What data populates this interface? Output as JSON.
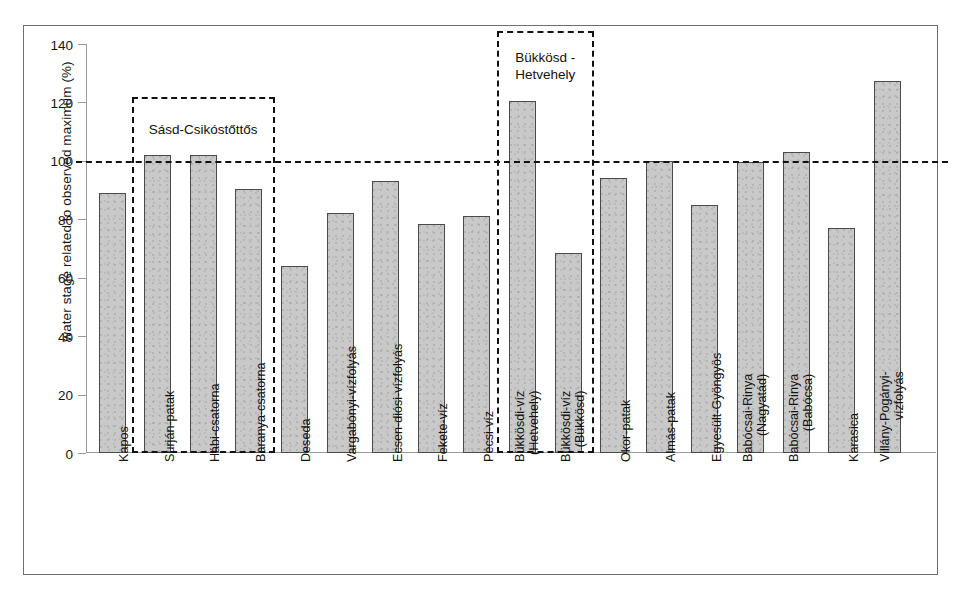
{
  "chart_data": {
    "type": "bar",
    "title": "",
    "subtitle": "",
    "xlabel": "",
    "ylabel": "water stage related to observed maximum (%)",
    "ylim": [
      0,
      140
    ],
    "yticks": [
      0,
      20,
      40,
      60,
      80,
      100,
      120,
      140
    ],
    "grid": false,
    "legend": "none",
    "bar_color": "#c9c9c9",
    "bar_edge_color": "#4a4a4a",
    "reference_lines": [
      {
        "name": "observed-maximum-100pct",
        "value": 100,
        "style": "dashed",
        "color": "#111111"
      }
    ],
    "categories": [
      "Kapos",
      "Surján-patak",
      "Hábi-csatorna",
      "Baranya-csatorna",
      "Deseda",
      "Vargabónyi-vízfolyás",
      "Ecsen-diósi-vízfolyás",
      "Fekete-víz",
      "Pécsi-víz",
      "Bükkösdi-víz (Hetvehely)",
      "Bükkösdi-víz (Bükkösd)",
      "Okor-patak",
      "Almás-patak",
      "Egyesült-Gyöngyös",
      "Babócsai-Rinya (Nagyatád)",
      "Babócsai-Rinya (Babócsa)",
      "Karasica",
      "Villány-Pogányi-vízfolyás"
    ],
    "category_lines": [
      [
        "Kapos"
      ],
      [
        "Surján-patak"
      ],
      [
        "Hábi-csatorna"
      ],
      [
        "Baranya-csatorna"
      ],
      [
        "Deseda"
      ],
      [
        "Vargabónyi-vízfolyás"
      ],
      [
        "Ecsen-diósi-vízfolyás"
      ],
      [
        "Fekete-víz"
      ],
      [
        "Pécsi-víz"
      ],
      [
        "Bükkösdi-víz",
        "(Hetvehely)"
      ],
      [
        "Bükkösdi-víz",
        "(Bükkösd)"
      ],
      [
        "Okor-patak"
      ],
      [
        "Almás-patak"
      ],
      [
        "Egyesült-Gyöngyös"
      ],
      [
        "Babócsai-Rinya",
        "(Nagyatád)"
      ],
      [
        "Babócsai-Rinya",
        "(Babócsa)"
      ],
      [
        "Karasica"
      ],
      [
        "Villány-Pogányi-",
        "vízfolyás"
      ]
    ],
    "values": [
      89,
      102,
      102,
      90.5,
      64,
      82,
      93,
      78.5,
      81,
      120.5,
      68.5,
      94,
      100,
      85,
      99.7,
      103,
      77,
      127.5
    ],
    "annotations": [
      {
        "name": "sasd-csikostottos",
        "label": "Sásd-Csikóstőttős",
        "covers": [
          "Surján-patak",
          "Hábi-csatorna",
          "Baranya-csatorna"
        ],
        "style": "dashed-box"
      },
      {
        "name": "bukkosd-hetvehely",
        "label": "Bükkösd -\nHetvehely",
        "covers": [
          "Bükkösdi-víz (Hetvehely)",
          "Bükkösdi-víz (Bükkösd)"
        ],
        "style": "dashed-box"
      }
    ]
  }
}
